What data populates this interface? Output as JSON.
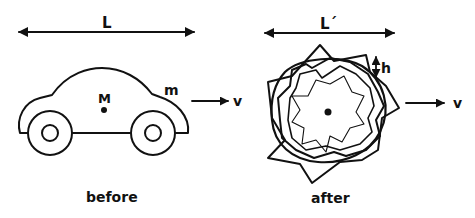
{
  "diagram": {
    "before": {
      "length_label": "L",
      "mass_center_label": "M",
      "mass_label": "m",
      "velocity_label": "v",
      "caption": "before"
    },
    "after": {
      "length_label": "L´",
      "height_label": "h",
      "velocity_label": "v",
      "caption": "after"
    },
    "colors": {
      "ink": "#111111",
      "background": "#ffffff"
    }
  }
}
